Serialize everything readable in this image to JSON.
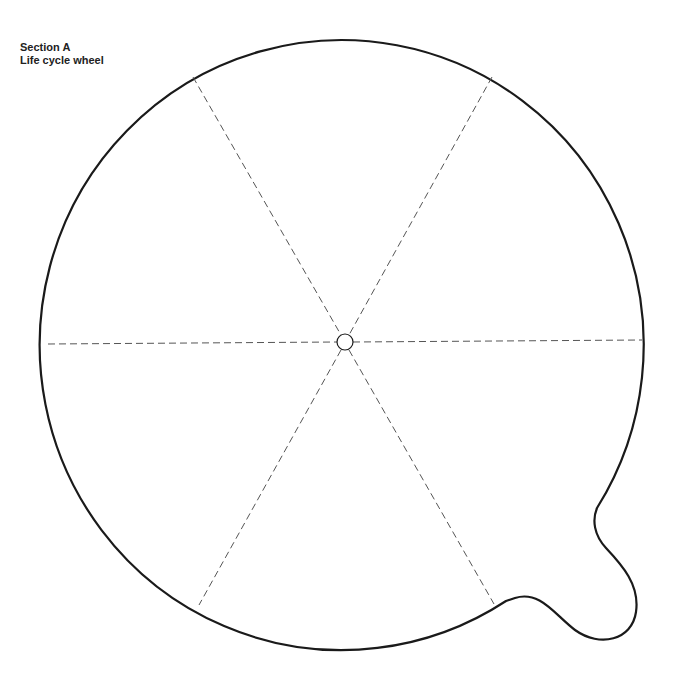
{
  "header": {
    "section": "Section A",
    "title": "Life cycle wheel"
  },
  "wheel": {
    "segments": 6,
    "stroke_color": "#1a1a1a",
    "divider_color": "#555555",
    "center": {
      "x": 345,
      "y": 342
    },
    "radius": 302
  }
}
